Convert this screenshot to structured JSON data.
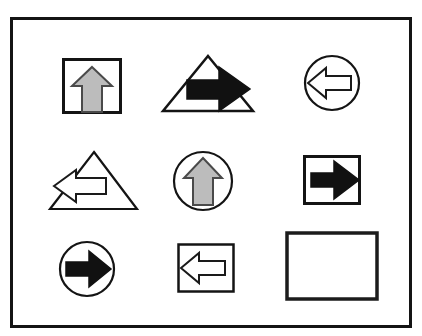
{
  "figure": {
    "kind": "matrix-reasoning-puzzle",
    "caption": "",
    "rows": 3,
    "columns": 3,
    "frame": {
      "border_color": "#141414",
      "background": "#ffffff"
    }
  },
  "palette": {
    "line": "#141414",
    "arrow_outline_fill": "#ffffff",
    "arrow_black_fill": "#111111",
    "arrow_gray_fill": "#bcbcbc",
    "arrow_gray_stroke": "#4a4a4a",
    "background": "#ffffff"
  },
  "cells": [
    {
      "position": "row1-col1",
      "container": "square",
      "arrow_direction": "up",
      "arrow_fill": "gray",
      "empty": false,
      "label": "gray up arrow in square"
    },
    {
      "position": "row1-col2",
      "container": "triangle",
      "arrow_direction": "right",
      "arrow_fill": "black",
      "empty": false,
      "label": "black right arrow in triangle"
    },
    {
      "position": "row1-col3",
      "container": "circle",
      "arrow_direction": "left",
      "arrow_fill": "white",
      "empty": false,
      "label": "white left arrow in circle"
    },
    {
      "position": "row2-col1",
      "container": "triangle",
      "arrow_direction": "left",
      "arrow_fill": "white",
      "empty": false,
      "label": "white left arrow in triangle"
    },
    {
      "position": "row2-col2",
      "container": "circle",
      "arrow_direction": "up",
      "arrow_fill": "gray",
      "empty": false,
      "label": "gray up arrow in circle"
    },
    {
      "position": "row2-col3",
      "container": "square",
      "arrow_direction": "right",
      "arrow_fill": "black",
      "empty": false,
      "label": "black right arrow in square"
    },
    {
      "position": "row3-col1",
      "container": "circle",
      "arrow_direction": "right",
      "arrow_fill": "black",
      "empty": false,
      "label": "black right arrow in circle"
    },
    {
      "position": "row3-col2",
      "container": "square",
      "arrow_direction": "left",
      "arrow_fill": "white",
      "empty": false,
      "label": "white left arrow in square"
    },
    {
      "position": "row3-col3",
      "container": "rectangle",
      "arrow_direction": "none",
      "arrow_fill": "none",
      "empty": true,
      "label": "empty answer cell"
    }
  ]
}
